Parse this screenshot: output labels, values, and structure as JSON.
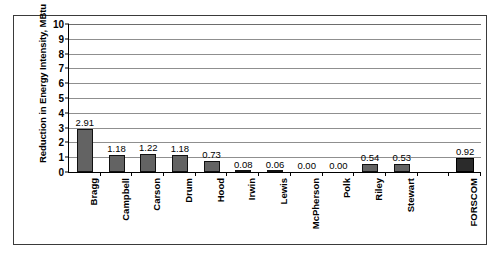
{
  "chart_data": {
    "type": "bar",
    "title": "",
    "xlabel": "",
    "ylabel": "Reduction in Energy Intensity, MBtu",
    "ylim": [
      0,
      10
    ],
    "yticks": [
      0,
      1,
      2,
      3,
      4,
      5,
      6,
      7,
      8,
      9,
      10
    ],
    "ytick_labels": [
      "0",
      "1",
      "2",
      "3",
      "4",
      "5",
      "6",
      "7",
      "8",
      "9",
      "10"
    ],
    "grid": true,
    "legend": false,
    "categories": [
      "Bragg",
      "Campbell",
      "Carson",
      "Drum",
      "Hood",
      "Irwin",
      "Lewis",
      "McPherson",
      "Polk",
      "Riley",
      "Stewart",
      "",
      "FORSCOM"
    ],
    "values": [
      2.91,
      1.18,
      1.22,
      1.18,
      0.73,
      0.08,
      0.06,
      0.0,
      0.0,
      0.54,
      0.53,
      null,
      0.92
    ],
    "value_labels": [
      "2.91",
      "1.18",
      "1.22",
      "1.18",
      "0.73",
      "0.08",
      "0.06",
      "0.00",
      "0.00",
      "0.54",
      "0.53",
      "",
      "0.92"
    ],
    "bar_colors": {
      "installation": "#636363",
      "total": "#2b2b2b",
      "outline": "#111111"
    }
  }
}
